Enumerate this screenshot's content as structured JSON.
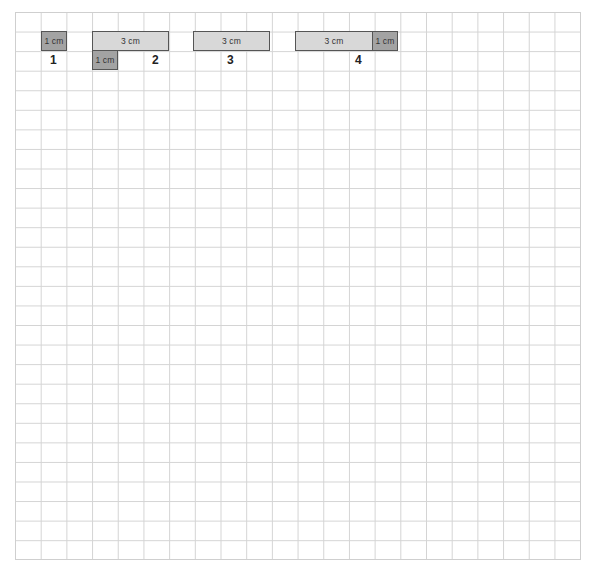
{
  "figure": {
    "grid": {
      "columns": 22,
      "rows": 28,
      "line_color": "#d4d4d4"
    },
    "colors": {
      "light_bar": "#d8d8d8",
      "dark_bar": "#a3a3a3",
      "border": "#555555"
    },
    "models": [
      {
        "label": "1",
        "bars": [
          {
            "text": "1 cm",
            "tone": "dark"
          }
        ]
      },
      {
        "label": "2",
        "bars": [
          {
            "text": "3 cm",
            "tone": "light"
          },
          {
            "text": "1 cm",
            "tone": "dark"
          }
        ]
      },
      {
        "label": "3",
        "bars": [
          {
            "text": "3 cm",
            "tone": "light"
          }
        ]
      },
      {
        "label": "4",
        "bars": [
          {
            "text": "3 cm",
            "tone": "light"
          },
          {
            "text": "1 cm",
            "tone": "dark"
          }
        ]
      }
    ]
  }
}
